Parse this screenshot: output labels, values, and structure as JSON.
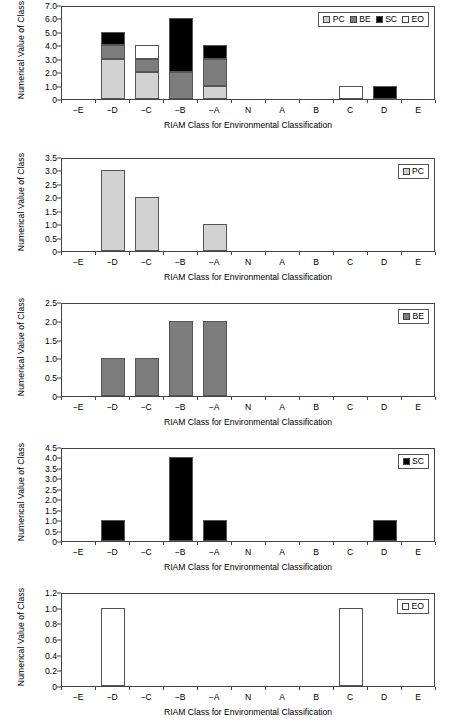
{
  "colors": {
    "PC": "#d2d2d2",
    "BE": "#7d7d7d",
    "SC": "#000000",
    "EO": "#ffffff",
    "axis": "#444444",
    "text": "#000000"
  },
  "axis_titles": {
    "x": "RIAM Class for Environmental Classification",
    "y": "Numerical Value of Class"
  },
  "categories": [
    "−E",
    "−D",
    "−C",
    "−B",
    "−A",
    "N",
    "A",
    "B",
    "C",
    "D",
    "E"
  ],
  "series_labels": {
    "PC": "PC",
    "BE": "BE",
    "SC": "SC",
    "EO": "EO"
  },
  "chart_data": [
    {
      "id": "combined",
      "type": "bar",
      "stacked": true,
      "title": "",
      "xlabel": "RIAM Class for Environmental Classification",
      "ylabel": "Numerical Value of Class",
      "categories": [
        "−E",
        "−D",
        "−C",
        "−B",
        "−A",
        "N",
        "A",
        "B",
        "C",
        "D",
        "E"
      ],
      "ylim": [
        0,
        7.0
      ],
      "yticks": [
        "0",
        "1.0",
        "2.0",
        "3.0",
        "4.0",
        "5.0",
        "6.0",
        "7.0"
      ],
      "ytick_values": [
        0,
        1.0,
        2.0,
        3.0,
        4.0,
        5.0,
        6.0,
        7.0
      ],
      "grid": false,
      "legend_position": "top-right",
      "legend": [
        "PC",
        "BE",
        "SC",
        "EO"
      ],
      "series": [
        {
          "name": "PC",
          "color": "#d2d2d2",
          "values": [
            0,
            3,
            2,
            0,
            1,
            0,
            0,
            0,
            0,
            0,
            0
          ]
        },
        {
          "name": "BE",
          "color": "#7d7d7d",
          "values": [
            0,
            1,
            1,
            2,
            2,
            0,
            0,
            0,
            0,
            0,
            0
          ]
        },
        {
          "name": "SC",
          "color": "#000000",
          "values": [
            0,
            1,
            0,
            4,
            1,
            0,
            0,
            0,
            0,
            1,
            0
          ]
        },
        {
          "name": "EO",
          "color": "#ffffff",
          "values": [
            0,
            0,
            1,
            0,
            0,
            0,
            0,
            0,
            1,
            0,
            0
          ]
        }
      ],
      "totals": [
        0,
        5,
        4,
        6,
        4,
        0,
        0,
        0,
        1,
        1,
        0
      ]
    },
    {
      "id": "pc",
      "type": "bar",
      "stacked": false,
      "title": "",
      "xlabel": "RIAM Class for Environmental Classification",
      "ylabel": "Numerical Value of Class",
      "categories": [
        "−E",
        "−D",
        "−C",
        "−B",
        "−A",
        "N",
        "A",
        "B",
        "C",
        "D",
        "E"
      ],
      "ylim": [
        0,
        3.5
      ],
      "yticks": [
        "0",
        "0.5",
        "1.0",
        "1.5",
        "2.0",
        "2.5",
        "3.0",
        "3.5"
      ],
      "ytick_values": [
        0,
        0.5,
        1.0,
        1.5,
        2.0,
        2.5,
        3.0,
        3.5
      ],
      "grid": false,
      "legend_position": "top-right",
      "legend": [
        "PC"
      ],
      "series": [
        {
          "name": "PC",
          "color": "#d2d2d2",
          "values": [
            0,
            3,
            2,
            0,
            1,
            0,
            0,
            0,
            0,
            0,
            0
          ]
        }
      ]
    },
    {
      "id": "be",
      "type": "bar",
      "stacked": false,
      "title": "",
      "xlabel": "RIAM Class for Environmental Classification",
      "ylabel": "Numerical Value of Class",
      "categories": [
        "−E",
        "−D",
        "−C",
        "−B",
        "−A",
        "N",
        "A",
        "B",
        "C",
        "D",
        "E"
      ],
      "ylim": [
        0,
        2.5
      ],
      "yticks": [
        "0",
        "0.5",
        "1.0",
        "1.5",
        "2.0",
        "2.5"
      ],
      "ytick_values": [
        0,
        0.5,
        1.0,
        1.5,
        2.0,
        2.5
      ],
      "grid": false,
      "legend_position": "top-right",
      "legend": [
        "BE"
      ],
      "series": [
        {
          "name": "BE",
          "color": "#7d7d7d",
          "values": [
            0,
            1,
            1,
            2,
            2,
            0,
            0,
            0,
            0,
            0,
            0
          ]
        }
      ]
    },
    {
      "id": "sc",
      "type": "bar",
      "stacked": false,
      "title": "",
      "xlabel": "RIAM Class for Environmental Classification",
      "ylabel": "Numerical Value of Class",
      "categories": [
        "−E",
        "−D",
        "−C",
        "−B",
        "−A",
        "N",
        "A",
        "B",
        "C",
        "D",
        "E"
      ],
      "ylim": [
        0,
        4.5
      ],
      "yticks": [
        "0",
        "0.5",
        "1.0",
        "1.5",
        "2.0",
        "2.5",
        "3.0",
        "3.5",
        "4.0",
        "4.5"
      ],
      "ytick_values": [
        0,
        0.5,
        1.0,
        1.5,
        2.0,
        2.5,
        3.0,
        3.5,
        4.0,
        4.5
      ],
      "grid": false,
      "legend_position": "top-right",
      "legend": [
        "SC"
      ],
      "series": [
        {
          "name": "SC",
          "color": "#000000",
          "values": [
            0,
            1,
            0,
            4,
            1,
            0,
            0,
            0,
            0,
            1,
            0
          ]
        }
      ]
    },
    {
      "id": "eo",
      "type": "bar",
      "stacked": false,
      "title": "",
      "xlabel": "RIAM Class for Environmental Classification",
      "ylabel": "Numerical Value of Class",
      "categories": [
        "−E",
        "−D",
        "−C",
        "−B",
        "−A",
        "N",
        "A",
        "B",
        "C",
        "D",
        "E"
      ],
      "ylim": [
        0,
        1.2
      ],
      "yticks": [
        "0",
        "0.2",
        "0.4",
        "0.6",
        "0.8",
        "1.0",
        "1.2"
      ],
      "ytick_values": [
        0,
        0.2,
        0.4,
        0.6,
        0.8,
        1.0,
        1.2
      ],
      "grid": false,
      "legend_position": "top-right",
      "legend": [
        "EO"
      ],
      "series": [
        {
          "name": "EO",
          "color": "#ffffff",
          "values": [
            0,
            1,
            0,
            0,
            0,
            0,
            0,
            0,
            1,
            0,
            0
          ]
        }
      ]
    }
  ]
}
